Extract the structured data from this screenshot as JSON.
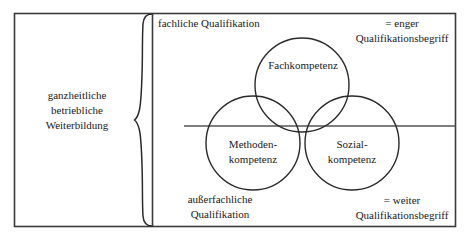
{
  "diagram": {
    "left_panel": {
      "label": "ganzheitliche\nbetriebliche\nWeiterbildung",
      "brace": "right-curly-brace"
    },
    "regions": {
      "upper_left_caption": "fachliche Qualifikation",
      "lower_left_caption": "außerfachliche\nQualifikation",
      "upper_right_caption": "= enger\nQualifikationsbegriff",
      "lower_right_caption": "= weiter\nQualifikationsbegriff"
    },
    "circles": [
      {
        "id": "fachkompetenz",
        "label": "Fachkompetenz",
        "cx": 302,
        "cy": 85,
        "r": 47
      },
      {
        "id": "methodenkompetenz",
        "label": "Methoden-\nkompetenz",
        "cx": 253,
        "cy": 143,
        "r": 47
      },
      {
        "id": "sozialkompetenz",
        "label": "Sozial-\nkompetenz",
        "cx": 352,
        "cy": 143,
        "r": 47
      }
    ],
    "colors": {
      "stroke": "#333333",
      "border": "#3a3a3a",
      "text": "#1a1a1a",
      "background": "#ffffff"
    },
    "geometry": {
      "outer_border": {
        "x": 14,
        "y": 13,
        "width": 442,
        "height": 214
      },
      "vertical_divider_x": 152,
      "horizontal_divider_y": 126,
      "horizontal_divider_x_start": 184,
      "horizontal_divider_x_end": 456
    }
  }
}
